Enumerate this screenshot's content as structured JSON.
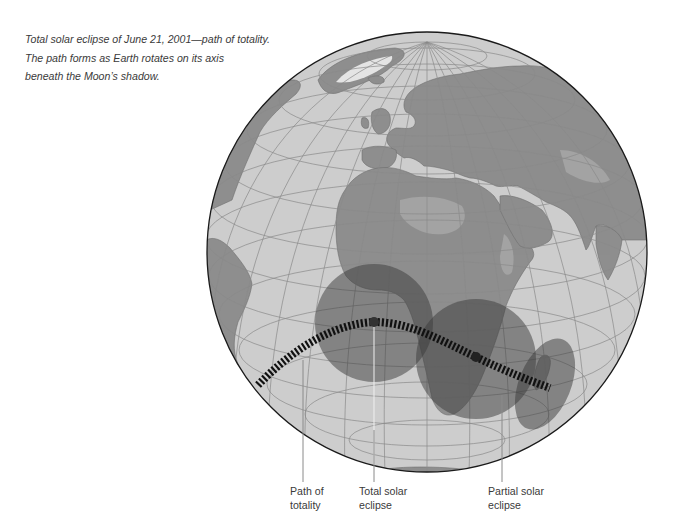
{
  "caption": {
    "lines": [
      "Total solar eclipse of June 21, 2001—path of totality.",
      "The path forms as Earth rotates on its axis",
      "beneath the Moon’s shadow."
    ]
  },
  "map": {
    "projection": "orthographic globe",
    "center": "Africa / Europe",
    "colors": {
      "ocean": "#cdcdcd",
      "land": "#8e8e8e",
      "land_light": "#a9a9a9",
      "ice": "#e4e4e4",
      "graticule": "#8a8a8a",
      "outline": "#1a1a1a",
      "shadow": "#3a3a3a",
      "path": "#111111"
    },
    "features": {
      "total_eclipse_shadow": "circle centered on path over Atlantic near Gulf of Guinea",
      "partial_eclipse_shadow": "circle over southern Africa",
      "partial_eclipse_ellipse": "elongated shadow over Madagascar",
      "path_of_totality": "dashed arc from South America across Atlantic and southern Africa to Madagascar"
    }
  },
  "labels": {
    "path_of_totality": [
      "Path of",
      "totality"
    ],
    "total_solar_eclipse": [
      "Total solar",
      "eclipse"
    ],
    "partial_solar_eclipse": [
      "Partial solar",
      "eclipse"
    ]
  }
}
